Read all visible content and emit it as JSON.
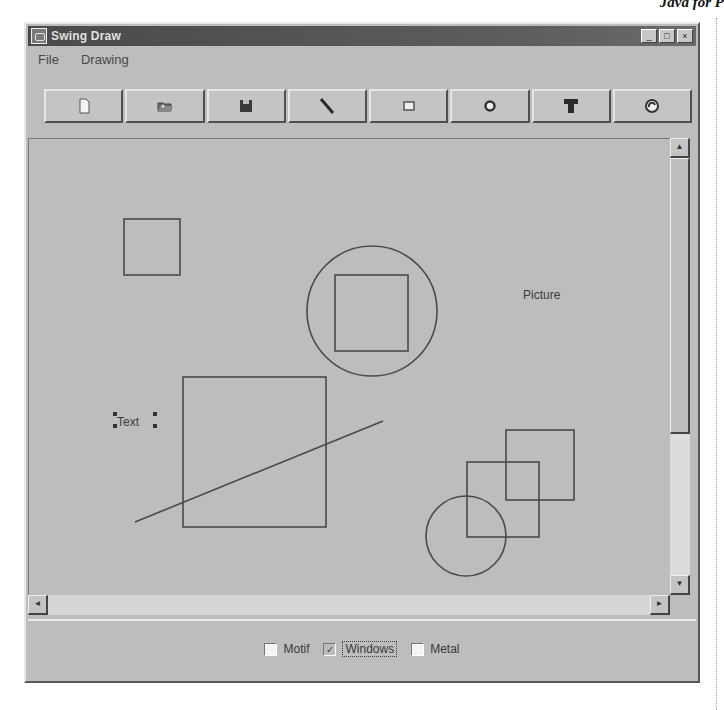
{
  "page": {
    "running_header": "Java for P"
  },
  "window": {
    "title": "Swing Draw",
    "controls": [
      {
        "name": "minimize",
        "glyph": "_"
      },
      {
        "name": "maximize",
        "glyph": "□"
      },
      {
        "name": "close",
        "glyph": "×"
      }
    ]
  },
  "menubar": {
    "items": [
      {
        "label": "File"
      },
      {
        "label": "Drawing"
      }
    ]
  },
  "toolbar": {
    "buttons": [
      {
        "name": "new",
        "icon": "new-document-icon"
      },
      {
        "name": "open",
        "icon": "open-folder-icon"
      },
      {
        "name": "save",
        "icon": "save-disk-icon"
      },
      {
        "name": "line",
        "icon": "line-tool-icon"
      },
      {
        "name": "rectangle",
        "icon": "rectangle-tool-icon"
      },
      {
        "name": "circle",
        "icon": "circle-tool-icon"
      },
      {
        "name": "text",
        "icon": "text-tool-icon"
      },
      {
        "name": "picture",
        "icon": "picture-tool-icon"
      }
    ]
  },
  "canvas": {
    "shapes": [
      {
        "type": "rect",
        "x": 95,
        "y": 80,
        "w": 56,
        "h": 56
      },
      {
        "type": "circle",
        "cx": 343,
        "cy": 172,
        "r": 65
      },
      {
        "type": "rect",
        "x": 306,
        "y": 136,
        "w": 73,
        "h": 76
      },
      {
        "type": "rect",
        "x": 154,
        "y": 238,
        "w": 143,
        "h": 150
      },
      {
        "type": "line",
        "x1": 106,
        "y1": 383,
        "x2": 354,
        "y2": 282
      },
      {
        "type": "text",
        "x": 88,
        "y": 287,
        "value": "Text",
        "selected": true
      },
      {
        "type": "text",
        "x": 494,
        "y": 160,
        "value": "Picture",
        "selected": false
      },
      {
        "type": "rect",
        "x": 477,
        "y": 291,
        "w": 68,
        "h": 70
      },
      {
        "type": "rect",
        "x": 438,
        "y": 323,
        "w": 72,
        "h": 75
      },
      {
        "type": "circle",
        "cx": 437,
        "cy": 397,
        "r": 40
      }
    ],
    "stroke_color": "#4a4a4a",
    "background": "#bdbdbd"
  },
  "scrollbars": {
    "vertical": {
      "up": "▲",
      "down": "▼"
    },
    "horizontal": {
      "left": "◄",
      "right": "►"
    }
  },
  "look_and_feel": {
    "options": [
      {
        "label": "Motif",
        "checked": false
      },
      {
        "label": "Windows",
        "checked": true
      },
      {
        "label": "Metal",
        "checked": false
      }
    ]
  }
}
